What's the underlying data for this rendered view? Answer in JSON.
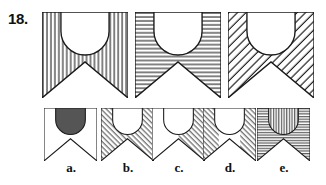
{
  "item": {
    "number_label": "18.",
    "type": "visual-analogy-multiple-choice"
  },
  "colors": {
    "ink": "#1a1a1a",
    "paper": "#ffffff",
    "hatch": "#222222",
    "solid_fill": "#555555"
  },
  "prompt": {
    "count": 3,
    "figures": [
      {
        "id": "prompt-figure-1",
        "shape": "banner-with-half-circle",
        "background_fill": "vertical-hatch",
        "inner_circle_fill": "white",
        "notch": "bottom-v-notch"
      },
      {
        "id": "prompt-figure-2",
        "shape": "banner-with-half-circle",
        "background_fill": "horizontal-hatch",
        "inner_circle_fill": "white",
        "notch": "bottom-v-notch"
      },
      {
        "id": "prompt-figure-3",
        "shape": "banner-with-half-circle",
        "background_fill": "diagonal-hatch-up",
        "inner_circle_fill": "white",
        "notch": "bottom-v-notch"
      }
    ]
  },
  "options": {
    "count": 5,
    "labels": [
      "a.",
      "b.",
      "c.",
      "d.",
      "e."
    ],
    "items": [
      {
        "id": "option-a",
        "label": "a.",
        "background_fill": "white",
        "inner_circle_fill": "solid-gray",
        "notch": "bottom-v-notch"
      },
      {
        "id": "option-b",
        "label": "b.",
        "background_fill": "diagonal-hatch-down",
        "inner_circle_fill": "white",
        "notch": "bottom-v-notch"
      },
      {
        "id": "option-c",
        "label": "c.",
        "background_fill": "diagonal-hatch-down-right-half-only",
        "inner_circle_fill": "white",
        "notch": "bottom-v-notch"
      },
      {
        "id": "option-d",
        "label": "d.",
        "background_fill": "diagonal-hatch-down-sides-only",
        "inner_circle_fill": "white",
        "notch": "bottom-v-notch"
      },
      {
        "id": "option-e",
        "label": "e.",
        "background_fill": "horizontal-hatch",
        "inner_circle_fill": "vertical-hatch",
        "notch": "bottom-v-notch"
      }
    ]
  }
}
